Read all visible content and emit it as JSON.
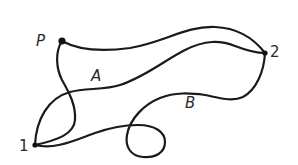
{
  "diagram": {
    "points": [
      {
        "id": "P",
        "label": "P",
        "x": 62,
        "y": 41
      },
      {
        "id": "2",
        "label": "2",
        "x": 265,
        "y": 53
      },
      {
        "id": "1",
        "label": "1",
        "x": 35,
        "y": 145
      }
    ],
    "paths": [
      {
        "id": "A",
        "label": "A",
        "from": "1",
        "to": "2"
      },
      {
        "id": "B",
        "label": "B",
        "from": "1",
        "to": "2"
      },
      {
        "id": "P-2",
        "label": "",
        "from": "P",
        "to": "2"
      },
      {
        "id": "P-1",
        "label": "",
        "from": "P",
        "to": "1"
      }
    ],
    "labels": {
      "point_p": "P",
      "point_1": "1",
      "point_2": "2",
      "path_a": "A",
      "path_b": "B"
    },
    "colors": {
      "stroke": "#1a1a1a",
      "text": "#2a2a2a",
      "background": "#ffffff"
    }
  }
}
